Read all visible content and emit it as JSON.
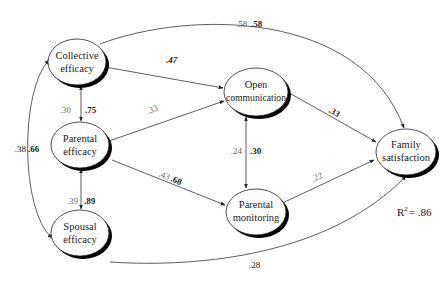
{
  "diagram": {
    "type": "path-model",
    "nodes": [
      {
        "id": "collective",
        "label_line1": "Collective",
        "label_line2": "efficacy",
        "cx": 77,
        "cy": 62,
        "rx": 29,
        "ry": 23
      },
      {
        "id": "parental_eff",
        "label_line1": "Parental",
        "label_line2": "efficacy",
        "cx": 80,
        "cy": 145,
        "rx": 29,
        "ry": 23
      },
      {
        "id": "spousal",
        "label_line1": "Spousal",
        "label_line2": "efficacy",
        "cx": 80,
        "cy": 233,
        "rx": 29,
        "ry": 23
      },
      {
        "id": "open_comm",
        "label_line1": "Open",
        "label_line2": "communication",
        "cx": 256,
        "cy": 92,
        "rx": 32,
        "ry": 24
      },
      {
        "id": "parental_mon",
        "label_line1": "Parental",
        "label_line2": "monitoring",
        "cx": 256,
        "cy": 212,
        "rx": 30,
        "ry": 23
      },
      {
        "id": "family_sat",
        "label_line1": "Family",
        "label_line2": "satisfaction",
        "cx": 406,
        "cy": 152,
        "rx": 30,
        "ry": 23
      }
    ],
    "edges": [
      {
        "from": "collective",
        "to": "open_comm",
        "type": "directed",
        "label_light": "",
        "label_bold": ".47"
      },
      {
        "from": "collective",
        "to": "family_sat",
        "type": "directed",
        "label_light": ".58",
        "label_bold": ".58"
      },
      {
        "from": "collective",
        "to": "parental_eff",
        "type": "bidirectional",
        "label_light": ".30",
        "label_bold": ".75"
      },
      {
        "from": "collective",
        "to": "spousal",
        "type": "bidirectional",
        "label_light": ".38",
        "label_bold": ".66"
      },
      {
        "from": "parental_eff",
        "to": "spousal",
        "type": "bidirectional",
        "label_light": ".39",
        "label_bold": ".89"
      },
      {
        "from": "parental_eff",
        "to": "open_comm",
        "type": "directed",
        "label_light": ".33",
        "label_bold": ""
      },
      {
        "from": "parental_eff",
        "to": "parental_mon",
        "type": "directed",
        "label_light": ".43",
        "label_bold": ".68"
      },
      {
        "from": "open_comm",
        "to": "parental_mon",
        "type": "bidirectional",
        "label_light": ".24",
        "label_bold": ".30"
      },
      {
        "from": "open_comm",
        "to": "family_sat",
        "type": "directed",
        "label_light": "",
        "label_bold": ".33"
      },
      {
        "from": "parental_mon",
        "to": "family_sat",
        "type": "directed",
        "label_light": ".22",
        "label_bold": ""
      },
      {
        "from": "spousal",
        "to": "family_sat",
        "type": "directed",
        "label_light": ".28",
        "label_bold": ""
      }
    ],
    "r_squared": {
      "label": "R",
      "superscript": "2",
      "value": "= .86"
    }
  }
}
